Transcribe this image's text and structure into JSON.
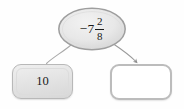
{
  "diagram": {
    "type": "math-mapping-diagram",
    "background_color": "#fefefe",
    "nodes": {
      "source": {
        "shape": "ellipse",
        "name": "mixed-number-node",
        "sign": "−",
        "whole": "7",
        "numerator": "2",
        "denominator": "8",
        "full_text": "−7 2/8",
        "fill_color": "#e6e6e6",
        "border_color": "#9e9e9e"
      },
      "left_target": {
        "shape": "rounded-rectangle",
        "name": "filled-answer-box",
        "value": "10",
        "fill_color": "#e4e4e4",
        "border_color": "#b8b8b8"
      },
      "right_target": {
        "shape": "rounded-rectangle",
        "name": "blank-answer-box",
        "value": "",
        "fill_color": "#ffffff",
        "border_color": "#bcbcbc"
      }
    },
    "connectors": [
      {
        "name": "connector-to-left-box",
        "from": "source",
        "to": "left_target",
        "style": "curved",
        "arrowhead": false,
        "color": "#a9a9a9"
      },
      {
        "name": "connector-to-right-box",
        "from": "source",
        "to": "right_target",
        "style": "curved",
        "arrowhead": true,
        "color": "#9a9a9a"
      }
    ]
  }
}
